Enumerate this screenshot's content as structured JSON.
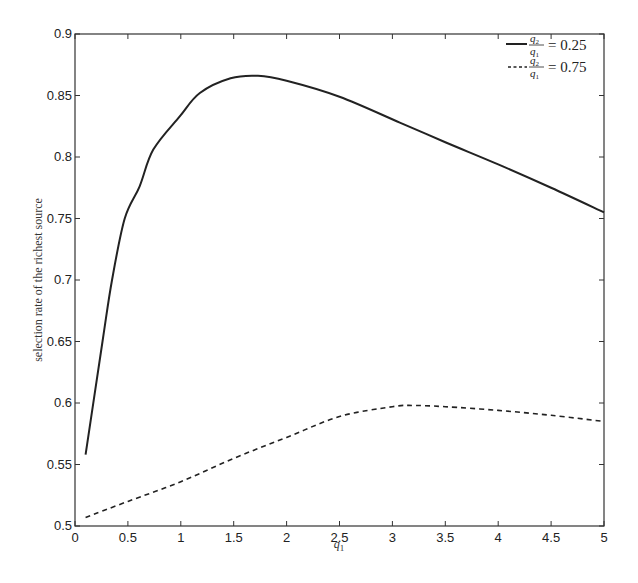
{
  "chart_data": {
    "type": "line",
    "title": "",
    "xlabel": "q1",
    "ylabel": "selection rate of the richest source",
    "xlim": [
      0,
      5
    ],
    "ylim": [
      0.5,
      0.9
    ],
    "xticks": [
      "0",
      "0.5",
      "1",
      "1.5",
      "2",
      "2.5",
      "3",
      "3.5",
      "4",
      "4.5",
      "5"
    ],
    "yticks": [
      "0.5",
      "0.55",
      "0.6",
      "0.65",
      "0.7",
      "0.75",
      "0.8",
      "0.85",
      "0.9"
    ],
    "grid": false,
    "legend_position": "upper right",
    "series": [
      {
        "name": "q2/q1 = 0.25",
        "style": "solid",
        "x": [
          0.1,
          0.26,
          0.35,
          0.47,
          0.61,
          0.74,
          0.99,
          1.18,
          1.47,
          1.73,
          2.0,
          2.5,
          3.07,
          3.5,
          4.0,
          4.5,
          5.0
        ],
        "values": [
          0.558,
          0.65,
          0.7,
          0.75,
          0.776,
          0.806,
          0.833,
          0.852,
          0.864,
          0.866,
          0.862,
          0.849,
          0.828,
          0.812,
          0.794,
          0.775,
          0.755
        ]
      },
      {
        "name": "q2/q1 = 0.75",
        "style": "dashed",
        "x": [
          0.1,
          0.5,
          1.0,
          1.5,
          2.0,
          2.5,
          3.0,
          3.2,
          3.5,
          4.0,
          4.5,
          5.0
        ],
        "values": [
          0.507,
          0.52,
          0.536,
          0.555,
          0.572,
          0.589,
          0.597,
          0.598,
          0.597,
          0.594,
          0.59,
          0.585
        ]
      }
    ]
  },
  "legend": {
    "entry1": {
      "numerator": "q",
      "num_sub": "2",
      "denominator": "q",
      "den_sub": "1",
      "value": "= 0.25"
    },
    "entry2": {
      "numerator": "q",
      "num_sub": "2",
      "denominator": "q",
      "den_sub": "1",
      "value": "= 0.75"
    }
  },
  "axes": {
    "xlabel_main": "q",
    "xlabel_sub": "1",
    "ylabel": "selection rate of the richest source"
  },
  "colors": {
    "line": "#222222",
    "axis": "#333333",
    "background": "#ffffff"
  }
}
